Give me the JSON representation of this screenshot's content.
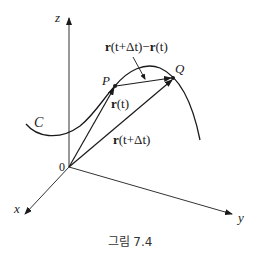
{
  "figure": {
    "caption": "그림 7.4",
    "axes": {
      "x_label": "x",
      "y_label": "y",
      "z_label": "z",
      "origin_label": "0"
    },
    "curve_label": "C",
    "points": {
      "p_label": "P",
      "q_label": "Q"
    },
    "vectors": {
      "r_t": {
        "bold": "r",
        "arg": "(t)"
      },
      "r_t_dt": {
        "bold": "r",
        "arg": "(t+Δt)"
      },
      "difference": {
        "bold1": "r",
        "arg1": "(t+Δt)",
        "minus": "−",
        "bold2": "r",
        "arg2": "(t)"
      }
    },
    "colors": {
      "ink": "#1a1a1a",
      "axis": "#333333",
      "caption": "#333333"
    }
  }
}
